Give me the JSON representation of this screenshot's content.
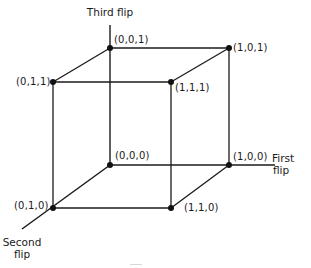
{
  "axes": {
    "third": {
      "line1": "Third flip",
      "line2": ""
    },
    "first": {
      "line1": "First",
      "line2": "flip"
    },
    "second": {
      "line1": "Second",
      "line2": "flip"
    }
  },
  "vertices": {
    "v001": {
      "label": "(0,0,1)",
      "x": 110,
      "y": 48
    },
    "v101": {
      "label": "(1,0,1)",
      "x": 229,
      "y": 48
    },
    "v011": {
      "label": "(0,1,1)",
      "x": 53,
      "y": 82
    },
    "v111": {
      "label": "(1,1,1)",
      "x": 171,
      "y": 82
    },
    "v000": {
      "label": "(0,0,0)",
      "x": 110,
      "y": 165
    },
    "v100": {
      "label": "(1,0,0)",
      "x": 229,
      "y": 165
    },
    "v010": {
      "label": "(0,1,0)",
      "x": 53,
      "y": 208
    },
    "v110": {
      "label": "(1,1,0)",
      "x": 171,
      "y": 208
    }
  },
  "colors": {
    "ink": "#1a1a1a",
    "background": "#ffffff"
  }
}
